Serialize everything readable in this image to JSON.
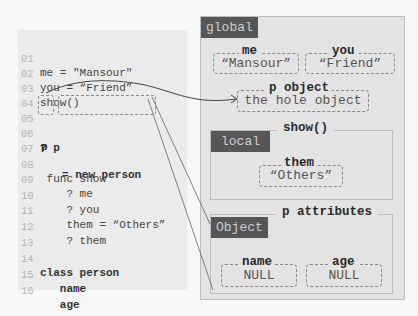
{
  "code": {
    "lines": [
      {
        "num": "01",
        "text": "me = \"Mansour\""
      },
      {
        "num": "02",
        "text": "you = “Friend”"
      },
      {
        "num": "03",
        "text": "show()"
      },
      {
        "num": "04",
        "text": ""
      },
      {
        "num": "05",
        "text_p": "p",
        "text_rest": "= new person"
      },
      {
        "num": "06",
        "text": "? p"
      },
      {
        "num": "07",
        "text": ""
      },
      {
        "num": "08",
        "text": " func show"
      },
      {
        "num": "09",
        "text": "    ? me"
      },
      {
        "num": "10",
        "text": "    ? you"
      },
      {
        "num": "11",
        "text": "    them = “Others”"
      },
      {
        "num": "12",
        "text": "    ? them"
      },
      {
        "num": "13",
        "text": ""
      },
      {
        "num": "14",
        "text": "class person"
      },
      {
        "num": "15",
        "text": "   name"
      },
      {
        "num": "16",
        "text": "   age"
      }
    ]
  },
  "global": {
    "tag": "global",
    "vars": [
      {
        "name": "me",
        "value": "“Mansour”"
      },
      {
        "name": "you",
        "value": "“Friend”"
      }
    ],
    "p_object": {
      "name": "p object",
      "value": "the hole object"
    },
    "show": {
      "title": "show()",
      "tag": "local",
      "var": {
        "name": "them",
        "value": "“Others”"
      }
    },
    "object": {
      "title": "p attributes",
      "tag": "Object",
      "attrs": [
        {
          "name": "name",
          "value": "NULL"
        },
        {
          "name": "age",
          "value": "NULL"
        }
      ]
    }
  },
  "colors": {
    "tag_bg": "#565656",
    "panel_bg": "#e3e3e3",
    "code_bg": "#ebebeb"
  }
}
